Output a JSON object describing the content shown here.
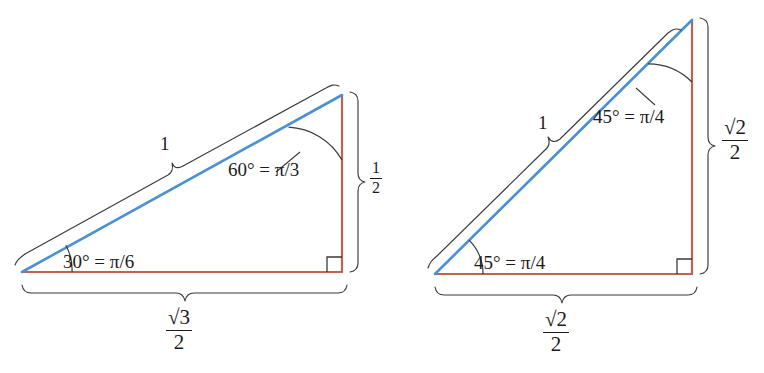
{
  "figure": {
    "background_color": "#ffffff",
    "hypotenuse_color": "#4a90d2",
    "leg_color": "#c0624f",
    "annotation_color": "#1b1b1b"
  },
  "triangles": [
    {
      "id": "triangle-30-60-90",
      "name": "30-60-90 triangle",
      "vertices": {
        "left": [
          22,
          272
        ],
        "right_angle": [
          342,
          272
        ],
        "apex": [
          342,
          95
        ]
      },
      "hypotenuse_label": "1",
      "base_label_numerator": "√3",
      "base_label_denominator": "2",
      "vertical_label_numerator": "1",
      "vertical_label_denominator": "2",
      "angle_bottom_left": "30° = π/6",
      "angle_top": "60° = π/3",
      "right_angle_marker": "right-angle-square"
    },
    {
      "id": "triangle-45-45-90",
      "name": "45-45-90 triangle",
      "vertices": {
        "left": [
          435,
          274
        ],
        "right_angle": [
          692,
          274
        ],
        "apex": [
          692,
          20
        ]
      },
      "hypotenuse_label": "1",
      "base_label_numerator": "√2",
      "base_label_denominator": "2",
      "vertical_label_numerator": "√2",
      "vertical_label_denominator": "2",
      "angle_bottom_left": "45° = π/4",
      "angle_top": "45° = π/4",
      "right_angle_marker": "right-angle-square"
    }
  ]
}
